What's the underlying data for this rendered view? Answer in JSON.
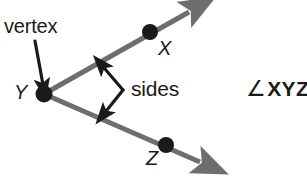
{
  "figure": {
    "background_color": "#ffffff",
    "ray_color": "#6e6e6e",
    "point_color": "#1a1a1a",
    "annotation_color": "#1a1a1a",
    "width": 307,
    "height": 176
  },
  "labels": {
    "vertex": "vertex",
    "sides": "sides",
    "point_x": "X",
    "point_y": "Y",
    "point_z": "Z",
    "angle_symbol": "∠",
    "angle_name": "XYZ"
  },
  "geometry": {
    "vertex_point": {
      "label": "Y",
      "x": 44,
      "y": 94
    },
    "points": [
      {
        "label": "X",
        "x": 150,
        "y": 32
      },
      {
        "label": "Z",
        "x": 166,
        "y": 145
      }
    ],
    "rays": [
      {
        "from": "Y",
        "through": "X",
        "tip_x": 195,
        "tip_y": 7
      },
      {
        "from": "Y",
        "through": "Z",
        "tip_x": 208,
        "tip_y": 167
      }
    ],
    "vertex_pointer_arrow": {
      "from_x": 35,
      "from_y": 41,
      "to_x": 43,
      "to_y": 87
    },
    "sides_pointer_arrow": {
      "elbow_x": 123,
      "elbow_y": 90,
      "tip_upper_x": 100,
      "tip_upper_y": 64,
      "tip_lower_x": 102,
      "tip_lower_y": 114
    }
  }
}
